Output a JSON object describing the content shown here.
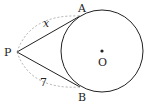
{
  "diagram": {
    "type": "geometry",
    "points": {
      "P": {
        "label": "P"
      },
      "A": {
        "label": "A"
      },
      "B": {
        "label": "B"
      },
      "O": {
        "label": "O"
      }
    },
    "segments": [
      {
        "from": "P",
        "to": "A",
        "label": "x"
      },
      {
        "from": "P",
        "to": "B",
        "label": "7"
      }
    ],
    "circle": {
      "center": "O"
    },
    "colors": {
      "line": "#222222",
      "dashed": "#999999"
    }
  }
}
